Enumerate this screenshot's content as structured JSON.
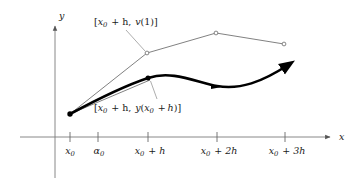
{
  "figure": {
    "axes": {
      "x_axis_label": "x",
      "y_axis_label": "y",
      "origin_px": [
        55,
        137
      ],
      "x_axis_from_px": [
        20,
        137
      ],
      "x_axis_to_px": [
        333,
        137
      ],
      "y_axis_from_px": [
        55,
        178
      ],
      "y_axis_to_px": [
        55,
        22
      ]
    },
    "ticks": [
      {
        "id": "x0",
        "x_px": 70,
        "label_main": "x",
        "label_sub": "0",
        "label_tail": ""
      },
      {
        "id": "alpha0",
        "x_px": 98,
        "label_main": "α",
        "label_sub": "0",
        "label_tail": ""
      },
      {
        "id": "x0h",
        "x_px": 148,
        "label_main": "x",
        "label_sub": "0",
        "label_tail": "+ h"
      },
      {
        "id": "x02h",
        "x_px": 217,
        "label_main": "x",
        "label_sub": "0",
        "label_tail": "+ 2h"
      },
      {
        "id": "x03h",
        "x_px": 285,
        "label_main": "x",
        "label_sub": "0",
        "label_tail": "+ 3h"
      }
    ],
    "callouts": [
      {
        "id": "euler-point",
        "text": "[x0 + h, v(1)]",
        "parts": {
          "open": "[",
          "var": "x",
          "sub": "0",
          "plus": "+ h,",
          "fn": "v",
          "arg": "(1)",
          "close": "]"
        },
        "label_px": [
          94,
          17
        ],
        "leader_from_px": [
          126,
          30
        ],
        "leader_to_px": [
          146,
          52
        ]
      },
      {
        "id": "exact-point",
        "text": "[x0 + h, y(x0 + h)]",
        "parts": {
          "open": "[",
          "var": "x",
          "sub": "0",
          "plus": "+ h,",
          "fn": "y",
          "arg": "(x0 + h)",
          "close": "]"
        },
        "label_px": [
          94,
          103
        ],
        "leader_from_px": [
          158,
          100
        ],
        "leader_to_px": [
          150,
          82
        ]
      }
    ],
    "series": {
      "euler_polyline": {
        "name": "euler-polyline",
        "color": "#6a6a6a",
        "stroke_width": 0.8,
        "points_px": [
          [
            70,
            114
          ],
          [
            147,
            53
          ],
          [
            216,
            33
          ],
          [
            284,
            44
          ]
        ],
        "vertex_marker": "open-circle"
      },
      "chord": {
        "name": "secant-chord",
        "color": "#6a6a6a",
        "stroke_width": 0.8,
        "points_px": [
          [
            70,
            114
          ],
          [
            150,
            80
          ]
        ]
      },
      "solution_curve": {
        "name": "exact-solution-curve",
        "color": "#000000",
        "stroke_width": 2.6,
        "path": "M 70 114 C 96 100, 124 86, 148 78 C 172 70, 196 82, 217 86 C 240 90, 262 82, 292 63",
        "start_marker": "filled-dot",
        "mid_markers_px": [
          [
            148,
            78
          ]
        ],
        "arrow_markers_px": [
          [
            217,
            86
          ],
          [
            292,
            63
          ]
        ]
      }
    },
    "colors": {
      "axis": "#7a7a7a",
      "thin_line": "#6a6a6a",
      "bold_curve": "#000000",
      "text": "#1a1a1a",
      "background": "#ffffff"
    }
  }
}
